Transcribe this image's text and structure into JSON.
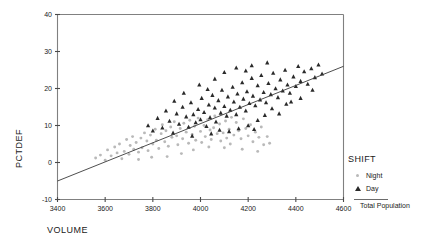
{
  "chart_data": {
    "type": "scatter",
    "title": "",
    "xlabel": "VOLUME",
    "ylabel": "PCTDEF",
    "xlim": [
      3400,
      4600
    ],
    "ylim": [
      -10,
      40
    ],
    "xticks": [
      3400,
      3600,
      3800,
      4000,
      4200,
      4400,
      4600
    ],
    "xtick_labels": [
      "3400",
      "3600",
      "3800",
      "4000",
      "4200",
      "4400",
      "4600"
    ],
    "yticks": [
      -10,
      0,
      10,
      20,
      30,
      40
    ],
    "ytick_labels": [
      "-10",
      "0",
      "10",
      "20",
      "30",
      "40"
    ],
    "grid": false,
    "legend_position": "right",
    "legend_title": "SHIFT",
    "series": [
      {
        "name": "Night",
        "marker": "dot",
        "color": "#b9b9b9",
        "points": [
          [
            3560,
            1.2
          ],
          [
            3580,
            2.0
          ],
          [
            3600,
            0.6
          ],
          [
            3610,
            3.4
          ],
          [
            3625,
            1.8
          ],
          [
            3640,
            4.2
          ],
          [
            3650,
            2.6
          ],
          [
            3660,
            5.0
          ],
          [
            3670,
            1.0
          ],
          [
            3680,
            3.0
          ],
          [
            3690,
            6.2
          ],
          [
            3700,
            2.2
          ],
          [
            3705,
            4.6
          ],
          [
            3715,
            7.0
          ],
          [
            3720,
            3.6
          ],
          [
            3730,
            5.4
          ],
          [
            3740,
            2.8
          ],
          [
            3750,
            6.6
          ],
          [
            3755,
            4.0
          ],
          [
            3765,
            8.0
          ],
          [
            3775,
            5.8
          ],
          [
            3780,
            3.2
          ],
          [
            3790,
            7.4
          ],
          [
            3800,
            5.0
          ],
          [
            3810,
            9.0
          ],
          [
            3815,
            6.0
          ],
          [
            3825,
            3.8
          ],
          [
            3835,
            7.8
          ],
          [
            3840,
            10.2
          ],
          [
            3850,
            5.6
          ],
          [
            3855,
            8.6
          ],
          [
            3865,
            4.4
          ],
          [
            3875,
            9.6
          ],
          [
            3880,
            6.8
          ],
          [
            3890,
            11.0
          ],
          [
            3900,
            7.2
          ],
          [
            3905,
            4.8
          ],
          [
            3915,
            9.2
          ],
          [
            3925,
            6.4
          ],
          [
            3930,
            10.6
          ],
          [
            3940,
            8.2
          ],
          [
            3950,
            5.2
          ],
          [
            3955,
            11.4
          ],
          [
            3965,
            7.6
          ],
          [
            3975,
            9.8
          ],
          [
            3980,
            6.0
          ],
          [
            3990,
            12.0
          ],
          [
            4000,
            8.4
          ],
          [
            4005,
            5.4
          ],
          [
            4015,
            10.0
          ],
          [
            4020,
            7.0
          ],
          [
            4030,
            11.6
          ],
          [
            4040,
            8.8
          ],
          [
            4045,
            6.2
          ],
          [
            4055,
            9.4
          ],
          [
            4060,
            12.6
          ],
          [
            4070,
            7.8
          ],
          [
            4080,
            10.4
          ],
          [
            4085,
            5.8
          ],
          [
            4095,
            8.0
          ],
          [
            4105,
            11.2
          ],
          [
            4110,
            6.6
          ],
          [
            4120,
            9.0
          ],
          [
            4130,
            12.2
          ],
          [
            4140,
            7.4
          ],
          [
            4150,
            10.8
          ],
          [
            4160,
            8.6
          ],
          [
            4170,
            6.4
          ],
          [
            4180,
            11.8
          ],
          [
            4190,
            9.2
          ],
          [
            4200,
            7.2
          ],
          [
            4210,
            10.2
          ],
          [
            4220,
            5.6
          ],
          [
            4230,
            8.2
          ],
          [
            4245,
            6.8
          ],
          [
            4255,
            9.6
          ],
          [
            4265,
            4.8
          ],
          [
            4280,
            7.0
          ],
          [
            4290,
            5.2
          ],
          [
            3920,
            2.4
          ],
          [
            3860,
            1.6
          ],
          [
            3795,
            1.4
          ],
          [
            3740,
            0.8
          ],
          [
            4035,
            4.2
          ],
          [
            4100,
            4.0
          ],
          [
            4175,
            3.6
          ],
          [
            4240,
            3.0
          ],
          [
            3970,
            3.4
          ],
          [
            4125,
            5.0
          ]
        ]
      },
      {
        "name": "Day",
        "marker": "triangle",
        "color": "#2a2a2a",
        "points": [
          [
            3780,
            10.0
          ],
          [
            3800,
            8.6
          ],
          [
            3820,
            12.0
          ],
          [
            3840,
            9.4
          ],
          [
            3855,
            14.0
          ],
          [
            3870,
            11.2
          ],
          [
            3885,
            8.0
          ],
          [
            3900,
            13.2
          ],
          [
            3910,
            10.4
          ],
          [
            3925,
            15.0
          ],
          [
            3940,
            12.4
          ],
          [
            3950,
            9.6
          ],
          [
            3960,
            16.2
          ],
          [
            3970,
            13.0
          ],
          [
            3980,
            10.8
          ],
          [
            3990,
            14.4
          ],
          [
            4000,
            11.6
          ],
          [
            4005,
            17.4
          ],
          [
            4015,
            13.6
          ],
          [
            4025,
            9.8
          ],
          [
            4035,
            15.6
          ],
          [
            4040,
            12.2
          ],
          [
            4050,
            18.2
          ],
          [
            4060,
            14.8
          ],
          [
            4065,
            11.0
          ],
          [
            4075,
            16.8
          ],
          [
            4085,
            13.4
          ],
          [
            4090,
            19.6
          ],
          [
            4100,
            15.2
          ],
          [
            4110,
            12.6
          ],
          [
            4115,
            17.8
          ],
          [
            4125,
            14.2
          ],
          [
            4135,
            20.4
          ],
          [
            4140,
            16.4
          ],
          [
            4150,
            13.0
          ],
          [
            4155,
            18.6
          ],
          [
            4165,
            15.0
          ],
          [
            4175,
            21.6
          ],
          [
            4180,
            17.2
          ],
          [
            4190,
            14.0
          ],
          [
            4195,
            19.2
          ],
          [
            4205,
            16.0
          ],
          [
            4215,
            22.8
          ],
          [
            4220,
            18.0
          ],
          [
            4230,
            15.4
          ],
          [
            4240,
            20.8
          ],
          [
            4250,
            17.0
          ],
          [
            4255,
            23.6
          ],
          [
            4265,
            19.0
          ],
          [
            4275,
            16.2
          ],
          [
            4285,
            21.4
          ],
          [
            4295,
            18.4
          ],
          [
            4305,
            24.2
          ],
          [
            4315,
            20.0
          ],
          [
            4325,
            17.6
          ],
          [
            4335,
            22.4
          ],
          [
            4345,
            19.4
          ],
          [
            4355,
            25.0
          ],
          [
            4365,
            21.0
          ],
          [
            4375,
            18.8
          ],
          [
            4390,
            23.2
          ],
          [
            4400,
            20.6
          ],
          [
            4410,
            26.0
          ],
          [
            4420,
            22.0
          ],
          [
            4435,
            24.6
          ],
          [
            4450,
            21.2
          ],
          [
            4465,
            25.4
          ],
          [
            4480,
            23.0
          ],
          [
            4495,
            26.4
          ],
          [
            4510,
            24.0
          ],
          [
            4100,
            24.4
          ],
          [
            4150,
            25.6
          ],
          [
            4215,
            26.2
          ],
          [
            4060,
            22.6
          ],
          [
            4280,
            27.0
          ],
          [
            3995,
            21.0
          ],
          [
            3930,
            18.8
          ],
          [
            3890,
            16.6
          ],
          [
            4030,
            19.8
          ],
          [
            4190,
            24.8
          ],
          [
            4120,
            8.4
          ],
          [
            4160,
            9.2
          ],
          [
            4200,
            10.0
          ],
          [
            4240,
            11.4
          ],
          [
            4270,
            12.8
          ],
          [
            4300,
            14.6
          ],
          [
            4330,
            13.2
          ],
          [
            4360,
            15.8
          ],
          [
            4045,
            7.8
          ],
          [
            4080,
            8.8
          ],
          [
            3965,
            7.2
          ],
          [
            4225,
            9.0
          ],
          [
            4380,
            16.4
          ],
          [
            4420,
            17.4
          ],
          [
            4470,
            19.6
          ]
        ]
      }
    ],
    "fit_line": {
      "label": "Total Population",
      "x_start": 3400,
      "y_start": -5.0,
      "x_end": 4600,
      "y_end": 26.0
    }
  },
  "legend": {
    "title": "SHIFT",
    "entries": [
      {
        "label": "Night",
        "marker": "dot-marker"
      },
      {
        "label": "Day",
        "marker": "triangle-marker"
      }
    ],
    "fit_label": "Total Population"
  },
  "axes": {
    "x_title": "VOLUME",
    "y_title": "PCTDEF"
  }
}
